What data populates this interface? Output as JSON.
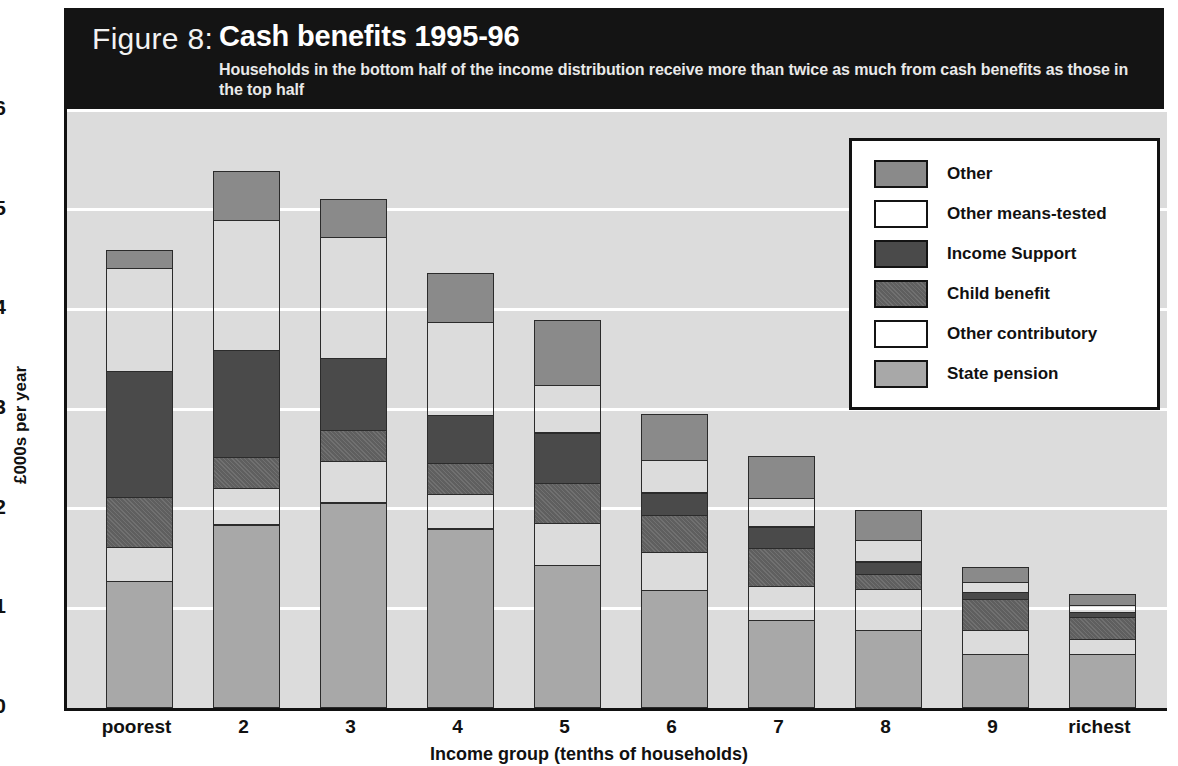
{
  "figure": {
    "number_label": "Figure 8:",
    "title": "Cash benefits 1995-96",
    "subtitle": "Households in the bottom half of the income distribution receive more than twice as much from cash benefits as those in the top half"
  },
  "colors": {
    "header_background": "#141414",
    "plot_background": "#dcdcdc",
    "gridline": "#ffffff",
    "segment_border": "#2b2b2b",
    "axis": "#111111",
    "other": "#8a8a8a",
    "other_means_tested": "#6e6e6e",
    "income_support": "#4a4a4a",
    "child_benefit": "#5f5f5f",
    "other_contributory": "#b4b4b4",
    "state_pension": "#a8a8a8"
  },
  "chart_data": {
    "type": "bar",
    "stacked": true,
    "title": "Cash benefits 1995-96",
    "subtitle": "Households in the bottom half of the income distribution receive more than twice as much from cash benefits as those in the top half",
    "xlabel": "Income group (tenths of households)",
    "ylabel": "£000s per year",
    "ylim": [
      0,
      6
    ],
    "yticks": [
      "0",
      "1",
      "2",
      "3",
      "4",
      "5",
      "6"
    ],
    "grid": true,
    "legend_position": "top-right",
    "categories": [
      "poorest",
      "2",
      "3",
      "4",
      "5",
      "6",
      "7",
      "8",
      "9",
      "richest"
    ],
    "series": [
      {
        "name": "State pension",
        "key": "state-pension",
        "values": [
          1.26,
          1.83,
          2.05,
          1.79,
          1.42,
          1.17,
          0.87,
          0.77,
          0.53,
          0.53
        ]
      },
      {
        "name": "Other contributory",
        "key": "other-contributory",
        "values": [
          0.35,
          0.37,
          0.42,
          0.35,
          0.43,
          0.39,
          0.34,
          0.41,
          0.24,
          0.15
        ]
      },
      {
        "name": "Child benefit",
        "key": "child-benefit",
        "values": [
          0.5,
          0.31,
          0.31,
          0.31,
          0.4,
          0.37,
          0.39,
          0.15,
          0.31,
          0.22
        ]
      },
      {
        "name": "Income Support",
        "key": "income-support",
        "values": [
          1.26,
          1.07,
          0.72,
          0.48,
          0.5,
          0.22,
          0.21,
          0.13,
          0.07,
          0.05
        ]
      },
      {
        "name": "Other means-tested",
        "key": "other-means-tested",
        "values": [
          1.03,
          1.31,
          1.22,
          0.93,
          0.48,
          0.33,
          0.29,
          0.22,
          0.1,
          0.07
        ]
      },
      {
        "name": "Other",
        "key": "other",
        "values": [
          0.18,
          0.48,
          0.37,
          0.49,
          0.65,
          0.45,
          0.41,
          0.29,
          0.15,
          0.11
        ]
      }
    ],
    "totals": [
      4.58,
      5.37,
      5.09,
      4.35,
      3.88,
      2.93,
      2.51,
      1.97,
      1.4,
      1.13
    ]
  },
  "legend": {
    "items": [
      {
        "label": "Other",
        "key": "other"
      },
      {
        "label": "Other means-tested",
        "key": "other-means-tested"
      },
      {
        "label": "Income Support",
        "key": "income-support"
      },
      {
        "label": "Child benefit",
        "key": "child-benefit"
      },
      {
        "label": "Other contributory",
        "key": "other-contributory"
      },
      {
        "label": "State pension",
        "key": "state-pension"
      }
    ]
  }
}
